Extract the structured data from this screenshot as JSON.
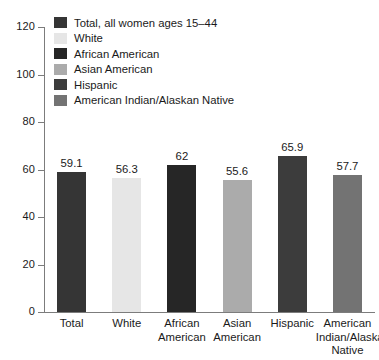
{
  "chart_data": {
    "type": "bar",
    "title": "",
    "xlabel": "",
    "ylabel": "",
    "ylim": [
      0,
      120
    ],
    "yticks": [
      0,
      20,
      40,
      60,
      80,
      100,
      120
    ],
    "grid": false,
    "legend_position": "top-left",
    "categories": [
      "Total",
      "White",
      "African American",
      "Asian American",
      "Hispanic",
      "American Indian/Alaskan Native"
    ],
    "category_label_lines": [
      [
        "Total"
      ],
      [
        "White"
      ],
      [
        "African",
        "American"
      ],
      [
        "Asian",
        "American"
      ],
      [
        "Hispanic"
      ],
      [
        "American",
        "Indian/Alaskan",
        "Native"
      ]
    ],
    "values": [
      59.1,
      56.3,
      62,
      55.6,
      65.9,
      57.7
    ],
    "value_labels": [
      "59.1",
      "56.3",
      "62",
      "55.6",
      "65.9",
      "57.7"
    ],
    "colors": [
      "#353535",
      "#e6e6e6",
      "#262626",
      "#ababab",
      "#3c3c3c",
      "#737373"
    ],
    "legend": [
      {
        "label": "Total, all women ages 15–44",
        "color": "#353535"
      },
      {
        "label": "White",
        "color": "#e6e6e6"
      },
      {
        "label": "African American",
        "color": "#262626"
      },
      {
        "label": "Asian American",
        "color": "#ababab"
      },
      {
        "label": "Hispanic",
        "color": "#3c3c3c"
      },
      {
        "label": "American Indian/Alaskan Native",
        "color": "#737373"
      }
    ],
    "axis_color": "#7c7c7c",
    "text_color": "#1a1a1a",
    "background": "#ffffff"
  }
}
